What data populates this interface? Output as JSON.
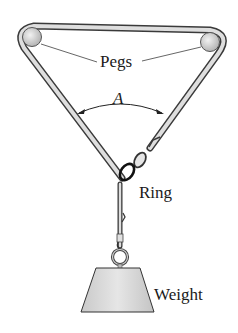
{
  "diagram": {
    "labels": {
      "pegs": "Pegs",
      "angle": "A",
      "ring": "Ring",
      "weight": "Weight"
    },
    "colors": {
      "rope_fill": "#d9d9d9",
      "rope_outline": "#333333",
      "peg_fill": "#cfcfcf",
      "weight_fill": "#d4d4d4",
      "text": "#1a1a1a",
      "background": "#ffffff"
    }
  }
}
